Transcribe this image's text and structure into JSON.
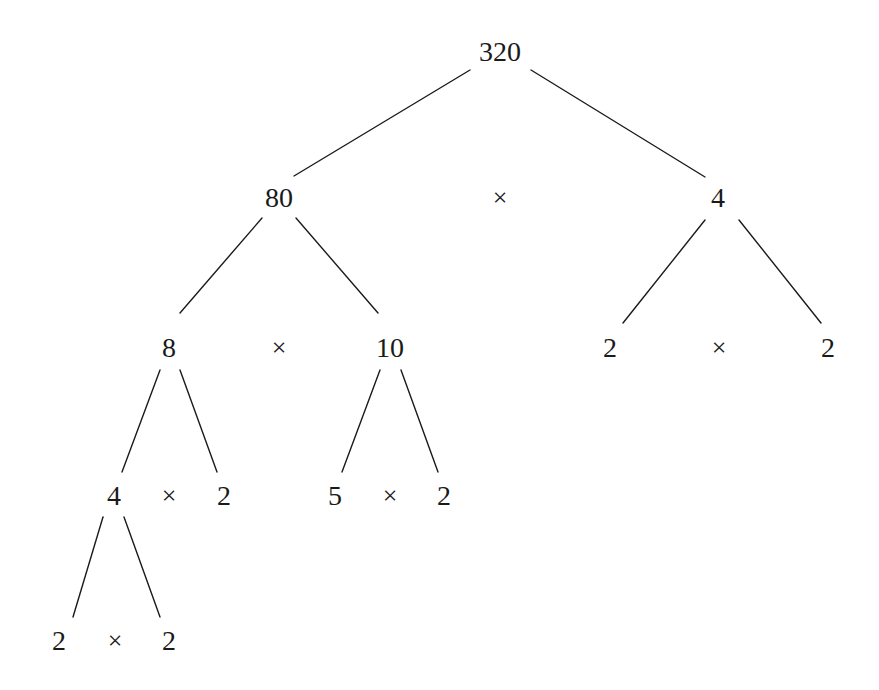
{
  "diagram": {
    "root": "320",
    "line_color": "#1a1a1a",
    "times_symbol": "×",
    "nodes": {
      "n320": {
        "label": "320"
      },
      "n80": {
        "label": "80"
      },
      "n4a": {
        "label": "4"
      },
      "n8": {
        "label": "8"
      },
      "n10": {
        "label": "10"
      },
      "n2a": {
        "label": "2"
      },
      "n2b": {
        "label": "2"
      },
      "n4b": {
        "label": "4"
      },
      "n2c": {
        "label": "2"
      },
      "n5": {
        "label": "5"
      },
      "n2d": {
        "label": "2"
      },
      "n2e": {
        "label": "2"
      },
      "n2f": {
        "label": "2"
      }
    },
    "multiplications": [
      {
        "left": "80",
        "symbol": "×",
        "right": "4",
        "product": "320"
      },
      {
        "left": "8",
        "symbol": "×",
        "right": "10",
        "product": "80"
      },
      {
        "left": "2",
        "symbol": "×",
        "right": "2",
        "product": "4"
      },
      {
        "left": "4",
        "symbol": "×",
        "right": "2",
        "product": "8"
      },
      {
        "left": "5",
        "symbol": "×",
        "right": "2",
        "product": "10"
      },
      {
        "left": "2",
        "symbol": "×",
        "right": "2",
        "product": "4"
      }
    ],
    "edges": [
      [
        "320",
        "80"
      ],
      [
        "320",
        "4"
      ],
      [
        "80",
        "8"
      ],
      [
        "80",
        "10"
      ],
      [
        "4",
        "2"
      ],
      [
        "4",
        "2"
      ],
      [
        "8",
        "4"
      ],
      [
        "8",
        "2"
      ],
      [
        "10",
        "5"
      ],
      [
        "10",
        "2"
      ],
      [
        "4",
        "2"
      ],
      [
        "4",
        "2"
      ]
    ]
  }
}
